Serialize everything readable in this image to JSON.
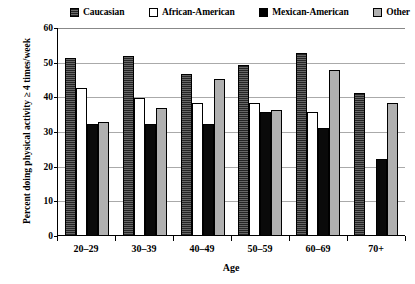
{
  "chart_data": {
    "type": "bar",
    "title": "",
    "xlabel": "Age",
    "ylabel": "Percent doing physical activity ≥ 4 times/week",
    "categories": [
      "20–29",
      "30–39",
      "40–49",
      "50–59",
      "60–69",
      "70+"
    ],
    "ylim": [
      0,
      60
    ],
    "yticks": [
      0,
      10,
      20,
      30,
      40,
      50,
      60
    ],
    "grid": true,
    "legend_position": "top",
    "series": [
      {
        "name": "Caucasian",
        "swatch": "dark-hatch",
        "color": "#4a4a4a",
        "values": [
          51,
          51.5,
          46.5,
          49,
          52.5,
          41
        ]
      },
      {
        "name": "African-American",
        "swatch": "white",
        "color": "#ffffff",
        "values": [
          42.5,
          39.5,
          38,
          38,
          35.5,
          0
        ]
      },
      {
        "name": "Mexican-American",
        "swatch": "black",
        "color": "#000000",
        "values": [
          32,
          32,
          32,
          35.5,
          31,
          22
        ]
      },
      {
        "name": "Other",
        "swatch": "gray",
        "color": "#b0b0b0",
        "values": [
          32.5,
          36.5,
          45,
          36,
          47.5,
          38
        ]
      }
    ]
  }
}
